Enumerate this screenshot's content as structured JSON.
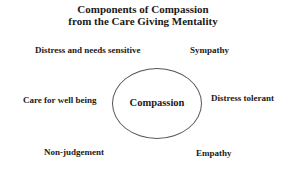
{
  "title": {
    "line1": "Components of Compassion",
    "line2": "from the Care Giving Mentality"
  },
  "center": {
    "label": "Compassion"
  },
  "components": [
    {
      "label": "Distress and needs sensitive"
    },
    {
      "label": "Sympathy"
    },
    {
      "label": "Care for well being"
    },
    {
      "label": "Distress tolerant"
    },
    {
      "label": "Non-judgement"
    },
    {
      "label": "Empathy"
    }
  ]
}
